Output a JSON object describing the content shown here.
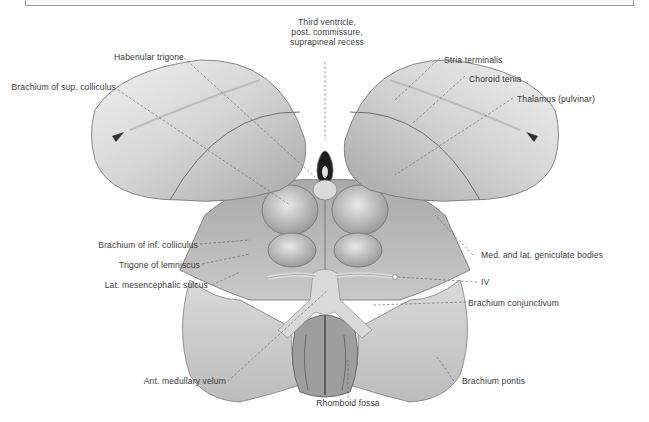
{
  "figure": {
    "colors": {
      "background": "#ffffff",
      "tissue_light": "#e6e6e6",
      "tissue_mid": "#bdbdbd",
      "tissue_dark": "#7c7c7c",
      "label_text": "#3a3a3a",
      "leader_line": "#555555",
      "frame": "#9a9a9a"
    }
  },
  "labels": {
    "third_ventricle": "Third ventricle,\npost. commissure,\nsuprapineal recess",
    "habenular_trigone": "Habenular trigone",
    "brachium_sup_colliculus": "Brachium of sup. colliculus",
    "stria_terminalis": "Stria terminalis",
    "choroid_tenia": "Choroid tenia",
    "thalamus_pulvinar": "Thalamus (pulvinar)",
    "brachium_inf_colliculus": "Brachium of inf. colliculus",
    "trigone_lemniscus": "Trigone of lemniscus",
    "lat_mesencephalic_sulcus": "Lat. mesencephalic sulcus",
    "geniculate_bodies": "Med. and lat. geniculate bodies",
    "iv": "IV",
    "brachium_conjunctivum": "Brachium conjunctivum",
    "ant_medullary_velum": "Ant. medullary velum",
    "brachium_pontis": "Brachium pontis",
    "rhomboid_fossa": "Rhomboid fossa"
  }
}
